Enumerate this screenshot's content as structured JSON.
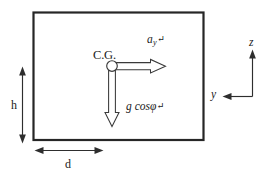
{
  "figure": {
    "type": "free-body-diagram",
    "background_color": "#ffffff",
    "stroke_color": "#262626",
    "body": {
      "shape": "rectangle",
      "label": "vehicle-body-outline"
    },
    "cg": {
      "label": "C.G.",
      "marker": "open-circle"
    },
    "vectors": [
      {
        "name": "lateral-acceleration",
        "symbol": "a",
        "subscript": "y",
        "return_mark": "↵",
        "direction": "right",
        "style": "hollow-arrow"
      },
      {
        "name": "gravity-component",
        "symbol": "g cos",
        "greek": "φ",
        "return_mark": "↵",
        "direction": "down",
        "style": "hollow-arrow"
      }
    ],
    "dimensions": [
      {
        "name": "height-dimension",
        "label": "h",
        "orientation": "vertical",
        "arrow": "double-headed"
      },
      {
        "name": "width-dimension",
        "label": "d",
        "orientation": "horizontal",
        "arrow": "double-headed"
      }
    ],
    "axes": {
      "name": "coordinate-axes",
      "vertical": {
        "label": "z",
        "direction": "up"
      },
      "horizontal": {
        "label": "y",
        "direction": "left"
      }
    }
  }
}
